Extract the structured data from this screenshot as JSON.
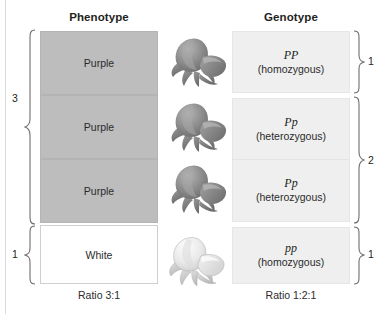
{
  "figure": {
    "columns": {
      "phenotype_heading": "Phenotype",
      "genotype_heading": "Genotype"
    },
    "colors": {
      "purple_fill": "#bdbdbd",
      "white_fill": "#ffffff",
      "genotype_fill": "#efefef",
      "text": "#231f20",
      "edge_rule": "#d9d9d9"
    }
  },
  "phenotype": {
    "rows": [
      {
        "label": "Purple",
        "fill": "purple"
      },
      {
        "label": "Purple",
        "fill": "purple"
      },
      {
        "label": "Purple",
        "fill": "purple"
      },
      {
        "label": "White",
        "fill": "white"
      }
    ],
    "brackets": [
      {
        "count": "3",
        "spans": 3
      },
      {
        "count": "1",
        "spans": 1
      }
    ],
    "ratio": "Ratio 3:1"
  },
  "genotype": {
    "rows": [
      {
        "allele": "PP",
        "zygosity": "(homozygous)"
      },
      {
        "allele": "Pp",
        "zygosity": "(heterozygous)"
      },
      {
        "allele": "Pp",
        "zygosity": "(heterozygous)"
      },
      {
        "allele": "pp",
        "zygosity": "(homozygous)"
      }
    ],
    "brackets": [
      {
        "count": "1",
        "spans": 1
      },
      {
        "count": "2",
        "spans": 2
      },
      {
        "count": "1",
        "spans": 1
      }
    ],
    "ratio": "Ratio 1:2:1"
  },
  "illustrations": [
    {
      "name": "rose-purple-1",
      "tone": "dark"
    },
    {
      "name": "rose-purple-2",
      "tone": "dark"
    },
    {
      "name": "rose-purple-3",
      "tone": "dark"
    },
    {
      "name": "rose-white",
      "tone": "light"
    }
  ]
}
